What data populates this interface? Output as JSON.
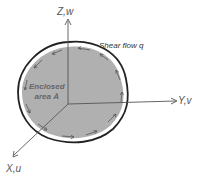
{
  "diagram": {
    "axes": {
      "z_label": "Z,w",
      "y_label": "Y,v",
      "x_label": "X,u"
    },
    "shear_flow_label": "Shear flow q",
    "area_label_line1": "Enclosed",
    "area_label_line2": "area Ā",
    "colors": {
      "fill": "#b0b0b0",
      "outline": "#222222",
      "axes": "#555555",
      "arrows": "#555555"
    }
  }
}
